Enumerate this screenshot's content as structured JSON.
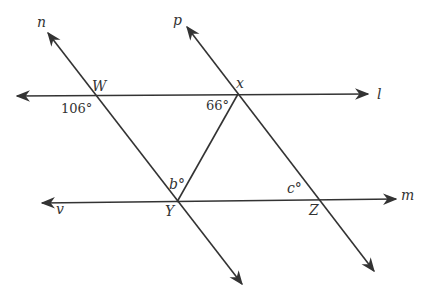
{
  "diagram": {
    "lines": {
      "l": {
        "label": "l"
      },
      "m": {
        "label": "m"
      },
      "n": {
        "label": "n"
      },
      "p": {
        "label": "p"
      },
      "v": {
        "label": "v"
      }
    },
    "points": {
      "W": {
        "label": "W"
      },
      "X": {
        "label": "x"
      },
      "Y": {
        "label": "Y"
      },
      "Z": {
        "label": "Z"
      }
    },
    "angles": {
      "at_W": {
        "label": "106°"
      },
      "at_X": {
        "label": "66°"
      },
      "at_Y": {
        "label": "b°"
      },
      "at_Z": {
        "label": "c°"
      }
    }
  }
}
